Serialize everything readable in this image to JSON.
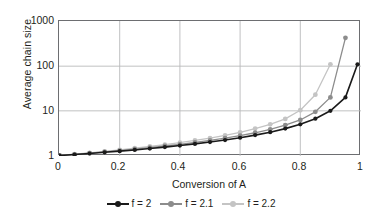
{
  "chart_data": {
    "type": "line",
    "title": "",
    "xlabel": "Conversion of A",
    "ylabel": "Average chain size",
    "xlim": [
      0,
      1
    ],
    "ylim": [
      1,
      1000
    ],
    "yscale": "log",
    "grid": true,
    "legend_position": "bottom",
    "xticks": [
      "0",
      "0.2",
      "0.4",
      "0.6",
      "0.8",
      "1"
    ],
    "xtick_values": [
      0,
      0.2,
      0.4,
      0.6,
      0.8,
      1
    ],
    "yticks": [
      "1",
      "10",
      "100",
      "1000"
    ],
    "ytick_values": [
      1,
      10,
      100,
      1000
    ],
    "x": [
      0,
      0.05,
      0.1,
      0.15,
      0.2,
      0.25,
      0.3,
      0.35,
      0.4,
      0.45,
      0.5,
      0.55,
      0.6,
      0.65,
      0.7,
      0.75,
      0.8,
      0.85,
      0.9,
      0.95,
      0.99
    ],
    "series": [
      {
        "name": "f = 2",
        "color": "#1a1a1a",
        "values": [
          1,
          1.05,
          1.11,
          1.18,
          1.25,
          1.33,
          1.43,
          1.54,
          1.67,
          1.82,
          2.0,
          2.22,
          2.5,
          2.86,
          3.33,
          4.0,
          5.0,
          6.67,
          10.0,
          20.0,
          110.0
        ]
      },
      {
        "name": "f = 2.1",
        "color": "#8c8c8c",
        "values": [
          1,
          1.06,
          1.13,
          1.21,
          1.29,
          1.39,
          1.5,
          1.63,
          1.78,
          1.96,
          2.18,
          2.44,
          2.78,
          3.23,
          3.85,
          4.76,
          6.25,
          9.5,
          20.0,
          430.0,
          null
        ]
      },
      {
        "name": "f = 2.2",
        "color": "#c4c4c4",
        "values": [
          1,
          1.07,
          1.15,
          1.24,
          1.34,
          1.46,
          1.59,
          1.75,
          1.94,
          2.17,
          2.44,
          2.81,
          3.3,
          4.0,
          5.0,
          6.6,
          10.3,
          23.0,
          110.0,
          null,
          null
        ]
      }
    ]
  },
  "legend": {
    "items": [
      {
        "label": "f = 2",
        "color": "#1a1a1a"
      },
      {
        "label": "f = 2.1",
        "color": "#8c8c8c"
      },
      {
        "label": "f = 2.2",
        "color": "#c4c4c4"
      }
    ]
  },
  "axes": {
    "y_title": "Average chain size",
    "x_title": "Conversion of A"
  }
}
